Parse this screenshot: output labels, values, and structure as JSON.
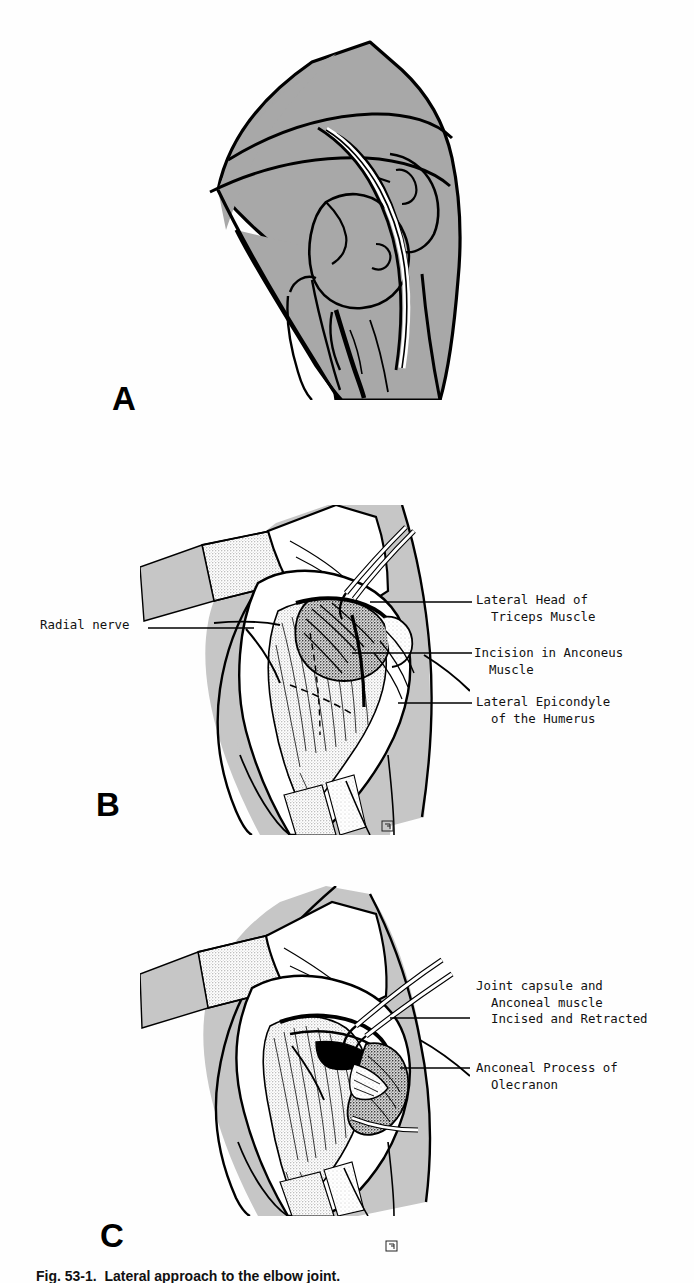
{
  "figure": {
    "caption": "Fig. 53-1.  Lateral approach to the elbow joint.",
    "page_background": "#fefefe",
    "ink_color": "#000000",
    "tissue_gray": "#a8a8a8",
    "stipple_gray": "#c9c9c9"
  },
  "panels": [
    {
      "id": "A",
      "letter": "A",
      "description": "Lateral view of the elbow showing the skin incision line over the joint"
    },
    {
      "id": "B",
      "letter": "B",
      "description": "Surgical exposure with anconeus muscle and lateral epicondyle revealed"
    },
    {
      "id": "C",
      "letter": "C",
      "description": "Joint capsule and anconeal muscle incised and retracted exposing the anconeal process"
    }
  ],
  "labels": {
    "panel_b": [
      {
        "id": "radial-nerve",
        "text": "Radial nerve",
        "side": "left",
        "lines": [
          "Radial nerve"
        ]
      },
      {
        "id": "lateral-head-triceps",
        "text": "Lateral Head of Triceps Muscle",
        "side": "right",
        "lines": [
          "Lateral Head of",
          "  Triceps Muscle"
        ]
      },
      {
        "id": "incision-anconeus",
        "text": "Incision in Anconeus Muscle",
        "side": "right",
        "lines": [
          "Incision in Anconeus",
          "  Muscle"
        ]
      },
      {
        "id": "lateral-epicondyle",
        "text": "Lateral Epicondyle of the Humerus",
        "side": "right",
        "lines": [
          "Lateral Epicondyle",
          "  of the Humerus"
        ]
      }
    ],
    "panel_c": [
      {
        "id": "joint-capsule-anconeal",
        "text": "Joint capsule and Anconeal muscle Incised and Retracted",
        "side": "right",
        "lines": [
          "Joint capsule and",
          "  Anconeal muscle",
          "  Incised and Retracted"
        ]
      },
      {
        "id": "anconeal-process",
        "text": "Anconeal Process of Olecranon",
        "side": "right",
        "lines": [
          "Anconeal Process of",
          "  Olecranon"
        ]
      }
    ]
  },
  "artist_signature": {
    "glyph": "⅁",
    "description": "small boxed artist monogram"
  }
}
